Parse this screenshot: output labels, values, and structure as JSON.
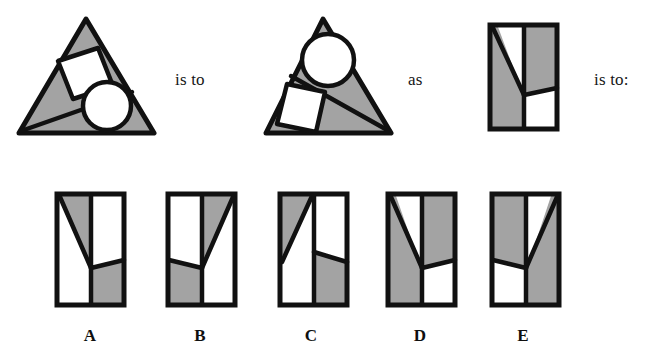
{
  "puzzle": {
    "type": "visual-analogy",
    "connectors": {
      "first": "is to",
      "second": "as",
      "third": "is to:"
    },
    "colors": {
      "fill_gray": "#a3a3a3",
      "fill_white": "#ffffff",
      "stroke": "#111111",
      "background": "#ffffff"
    },
    "stem": {
      "figure_a": {
        "name": "triangle-with-square-and-circle",
        "shape": "triangle",
        "ground_fill": "gray",
        "inner_shapes": [
          "square",
          "circle",
          "diagonal-line"
        ],
        "square_position": "upper-middle",
        "circle_position": "lower-right",
        "diagonal_from": "bottom-left-corner"
      },
      "figure_b": {
        "name": "triangle-mirrored-square-and-circle",
        "shape": "triangle",
        "ground_fill": "gray",
        "inner_shapes": [
          "circle",
          "square",
          "diagonal-line"
        ],
        "square_position": "lower-left",
        "circle_position": "upper-middle",
        "diagonal_from": "bottom-right-corner"
      },
      "figure_c": {
        "name": "rectangle-y-partition",
        "shape": "rectangle",
        "regions": [
          "left-gray",
          "top-center-white",
          "right-gray",
          "bottom-right-white"
        ],
        "partition": "y-shape"
      }
    },
    "options": [
      {
        "label": "A",
        "name": "option-a",
        "regions": "left-white, upper-gray-wedge, right-upper-white, lower-right-gray"
      },
      {
        "label": "B",
        "name": "option-b",
        "regions": "upper-left-white, upper-right-gray, lower-left-gray, lower-right-white"
      },
      {
        "label": "C",
        "name": "option-c",
        "regions": "upper-left-gray-wedge, lower-left-white, right-upper-white, right-lower-gray"
      },
      {
        "label": "D",
        "name": "option-d",
        "regions": "left-gray, top-center-white, right-gray, bottom-right-white"
      },
      {
        "label": "E",
        "name": "option-e",
        "regions": "left-gray, top-right-white, right-gray, bottom-left-white"
      }
    ]
  }
}
